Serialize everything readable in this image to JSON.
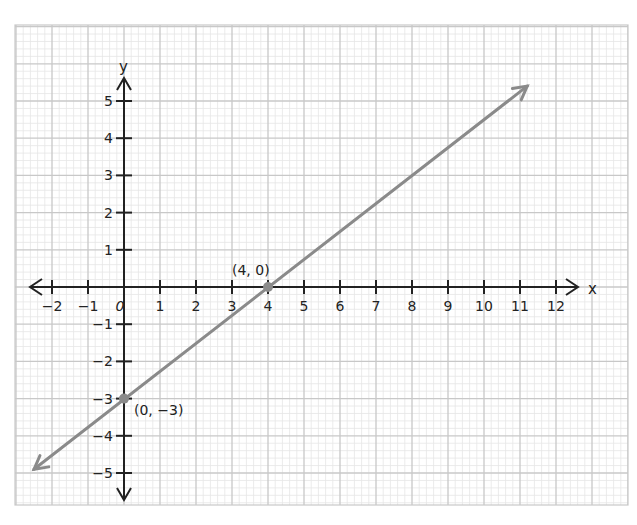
{
  "chart_data": {
    "type": "line",
    "title": "",
    "xlabel": "x",
    "ylabel": "y",
    "xlim": [
      -2,
      12
    ],
    "ylim": [
      -5,
      5
    ],
    "grid": true,
    "x_ticks": [
      -2,
      -1,
      0,
      1,
      2,
      3,
      4,
      5,
      6,
      7,
      8,
      9,
      10,
      11,
      12
    ],
    "x_tick_labels": [
      "−2",
      "−1",
      "0",
      "1",
      "2",
      "3",
      "4",
      "5",
      "6",
      "7",
      "8",
      "9",
      "10",
      "11",
      "12"
    ],
    "y_ticks": [
      -5,
      -4,
      -3,
      -2,
      -1,
      1,
      2,
      3,
      4,
      5
    ],
    "y_tick_labels": [
      "−5",
      "−4",
      "−3",
      "−2",
      "−1",
      "1",
      "2",
      "3",
      "4",
      "5"
    ],
    "series": [
      {
        "name": "line",
        "equation": "y = 0.75x - 3",
        "x": [
          -2.5,
          11.2
        ],
        "y": [
          -4.9,
          5.4
        ],
        "color": "#8a8a8a",
        "arrows_both_ends": true
      }
    ],
    "points": [
      {
        "x": 4,
        "y": 0,
        "label": "(4, 0)"
      },
      {
        "x": 0,
        "y": -3,
        "label": "(0, −3)"
      }
    ],
    "annotations": [
      "(4, 0)",
      "(0, −3)"
    ]
  },
  "colors": {
    "axis": "#222222",
    "line": "#8a8a8a",
    "grid_major": "#c8c8c8",
    "grid_minor": "#e6e6e6"
  }
}
